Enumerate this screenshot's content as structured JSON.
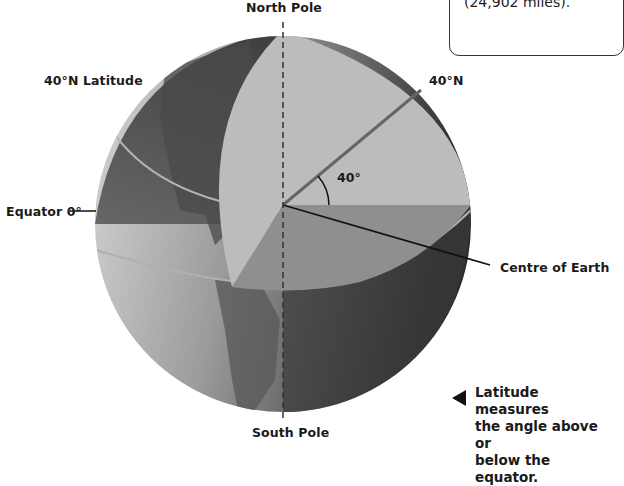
{
  "diagram": {
    "title_top": "North Pole",
    "title_bottom": "South Pole",
    "labels": {
      "latitude_line": "40°N Latitude",
      "equator": "Equator 0°",
      "angle_end": "40°N",
      "angle": "40°",
      "centre": "Centre of Earth"
    }
  },
  "info_box": {
    "line1": "40,075 kilometres",
    "line2": "(24,902 miles)."
  },
  "caption": {
    "line1": "Latitude measures",
    "line2": "the angle above or",
    "line3": "below the equator."
  },
  "colors": {
    "globe_light": "#c8c8c8",
    "globe_dark": "#3a3a3a",
    "cutaway_upper": "#b9b9b9",
    "cutaway_lower": "#8e8e8e",
    "land": "#5a5a5a"
  }
}
